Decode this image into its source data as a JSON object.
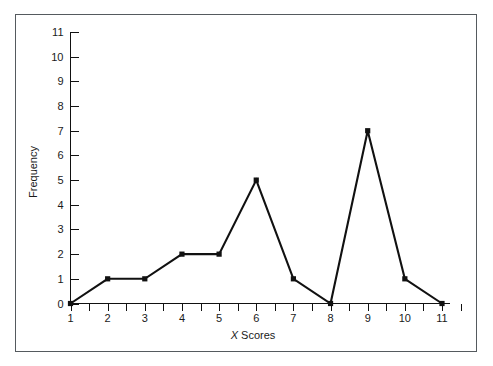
{
  "figure": {
    "background_color": "#ffffff",
    "border_color": "#555a5e",
    "line_color": "#111111",
    "text_color": "#1a1a1a"
  },
  "chart_data": {
    "type": "line",
    "title": "",
    "subtitle": "",
    "xlabel": "X Scores",
    "xlabel_italic_prefix": "X",
    "xlabel_rest": " Scores",
    "ylabel": "Frequency",
    "x": [
      1,
      2,
      3,
      4,
      5,
      6,
      7,
      8,
      9,
      10,
      11
    ],
    "values": [
      0,
      1,
      1,
      2,
      2,
      5,
      1,
      0,
      7,
      1,
      0
    ],
    "series": [
      {
        "name": "Frequency",
        "values": [
          0,
          1,
          1,
          2,
          2,
          5,
          1,
          0,
          7,
          1,
          0
        ]
      }
    ],
    "xlim": [
      1,
      11
    ],
    "ylim": [
      0,
      11
    ],
    "x_tick_labels": [
      "1",
      "2",
      "3",
      "4",
      "5",
      "6",
      "7",
      "8",
      "9",
      "10",
      "11"
    ],
    "y_tick_labels": [
      "0",
      "1",
      "2",
      "3",
      "4",
      "5",
      "6",
      "7",
      "8",
      "9",
      "10",
      "11"
    ],
    "x_minor_tick_interval": 0.5,
    "y_tick_interval": 1,
    "grid": false,
    "legend": false,
    "legend_position": "none",
    "marker": "square",
    "marker_color": "#111111",
    "line_color": "#111111",
    "annotations": []
  }
}
